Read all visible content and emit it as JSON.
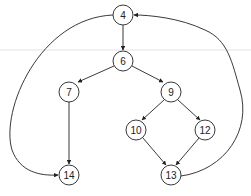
{
  "diagram": {
    "type": "control-flow-graph",
    "nodes": [
      {
        "id": "4",
        "label": "4",
        "x": 123,
        "y": 15
      },
      {
        "id": "6",
        "label": "6",
        "x": 123,
        "y": 61
      },
      {
        "id": "7",
        "label": "7",
        "x": 69,
        "y": 92
      },
      {
        "id": "9",
        "label": "9",
        "x": 171,
        "y": 92
      },
      {
        "id": "10",
        "label": "10",
        "x": 136,
        "y": 130
      },
      {
        "id": "12",
        "label": "12",
        "x": 205,
        "y": 130
      },
      {
        "id": "13",
        "label": "13",
        "x": 171,
        "y": 175
      },
      {
        "id": "14",
        "label": "14",
        "x": 69,
        "y": 175
      }
    ],
    "edges": [
      {
        "from": "4",
        "to": "6"
      },
      {
        "from": "4",
        "to": "14",
        "curved": true
      },
      {
        "from": "6",
        "to": "7"
      },
      {
        "from": "6",
        "to": "9"
      },
      {
        "from": "7",
        "to": "14"
      },
      {
        "from": "9",
        "to": "10"
      },
      {
        "from": "9",
        "to": "12"
      },
      {
        "from": "10",
        "to": "13"
      },
      {
        "from": "12",
        "to": "13"
      },
      {
        "from": "13",
        "to": "4",
        "curved": true
      }
    ],
    "colors": {
      "stroke": "#222222",
      "fill": "#ffffff",
      "guide": "#e2e2e2"
    }
  }
}
